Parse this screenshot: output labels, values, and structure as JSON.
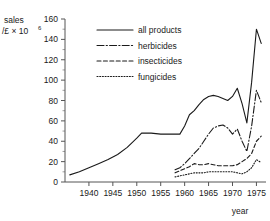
{
  "chart_data": {
    "type": "line",
    "title": "",
    "xlabel": "year",
    "ylabel": "sales /£ × 10⁶",
    "ylabel_main": "sales",
    "ylabel_unit": "/£ × 10",
    "ylabel_exponent": "6",
    "xlim": [
      1935,
      1977
    ],
    "ylim": [
      0,
      160
    ],
    "grid": false,
    "legend_position": "top-center",
    "y_ticks": [
      0,
      20,
      40,
      60,
      80,
      100,
      120,
      140,
      160
    ],
    "y_tick_labels": [
      "0",
      "20",
      "40",
      "60",
      "80",
      "100",
      "120",
      "140",
      "160"
    ],
    "y_minor_step": 10,
    "x_ticks": [
      1940,
      1945,
      1950,
      1955,
      1960,
      1965,
      1970,
      1975
    ],
    "x_tick_labels": [
      "1940",
      "1945",
      "1950",
      "1955",
      "1960",
      "1965",
      "1970",
      "1975"
    ],
    "series": [
      {
        "name": "all products",
        "style": "solid",
        "points": [
          [
            1936,
            7
          ],
          [
            1938,
            10
          ],
          [
            1940,
            14
          ],
          [
            1942,
            18
          ],
          [
            1944,
            22
          ],
          [
            1946,
            27
          ],
          [
            1948,
            34
          ],
          [
            1950,
            43
          ],
          [
            1951,
            48
          ],
          [
            1953,
            48
          ],
          [
            1955,
            47
          ],
          [
            1957,
            47
          ],
          [
            1959,
            47
          ],
          [
            1960,
            55
          ],
          [
            1961,
            66
          ],
          [
            1962,
            70
          ],
          [
            1963,
            76
          ],
          [
            1964,
            81
          ],
          [
            1965,
            84
          ],
          [
            1966,
            85
          ],
          [
            1967,
            84
          ],
          [
            1968,
            82
          ],
          [
            1969,
            80
          ],
          [
            1970,
            84
          ],
          [
            1971,
            92
          ],
          [
            1972,
            77
          ],
          [
            1973,
            58
          ],
          [
            1974,
            98
          ],
          [
            1975,
            150
          ],
          [
            1976,
            136
          ]
        ]
      },
      {
        "name": "herbicides",
        "style": "dash-dot",
        "points": [
          [
            1958,
            12
          ],
          [
            1959,
            14
          ],
          [
            1960,
            18
          ],
          [
            1961,
            23
          ],
          [
            1962,
            28
          ],
          [
            1963,
            33
          ],
          [
            1964,
            40
          ],
          [
            1965,
            47
          ],
          [
            1966,
            53
          ],
          [
            1967,
            55
          ],
          [
            1968,
            56
          ],
          [
            1969,
            53
          ],
          [
            1970,
            47
          ],
          [
            1971,
            52
          ],
          [
            1972,
            40
          ],
          [
            1973,
            30
          ],
          [
            1974,
            55
          ],
          [
            1975,
            90
          ],
          [
            1976,
            78
          ]
        ]
      },
      {
        "name": "insecticides",
        "style": "dashed",
        "points": [
          [
            1958,
            9
          ],
          [
            1959,
            11
          ],
          [
            1960,
            13
          ],
          [
            1961,
            15
          ],
          [
            1962,
            18
          ],
          [
            1963,
            17
          ],
          [
            1964,
            17
          ],
          [
            1965,
            18
          ],
          [
            1966,
            17
          ],
          [
            1967,
            16
          ],
          [
            1968,
            16
          ],
          [
            1969,
            16
          ],
          [
            1970,
            16
          ],
          [
            1971,
            17
          ],
          [
            1972,
            20
          ],
          [
            1973,
            23
          ],
          [
            1974,
            28
          ],
          [
            1975,
            40
          ],
          [
            1976,
            45
          ]
        ]
      },
      {
        "name": "fungicides",
        "style": "dotted",
        "points": [
          [
            1958,
            5
          ],
          [
            1959,
            6
          ],
          [
            1960,
            7
          ],
          [
            1961,
            8
          ],
          [
            1962,
            9
          ],
          [
            1963,
            9
          ],
          [
            1964,
            9
          ],
          [
            1965,
            10
          ],
          [
            1966,
            10
          ],
          [
            1967,
            10
          ],
          [
            1968,
            10
          ],
          [
            1969,
            10
          ],
          [
            1970,
            10
          ],
          [
            1971,
            9
          ],
          [
            1972,
            8
          ],
          [
            1973,
            10
          ],
          [
            1974,
            14
          ],
          [
            1975,
            22
          ],
          [
            1976,
            19
          ]
        ]
      }
    ],
    "legend": [
      {
        "label": "all products",
        "style": "solid"
      },
      {
        "label": "herbicides",
        "style": "dash-dot"
      },
      {
        "label": "insecticides",
        "style": "dashed"
      },
      {
        "label": "fungicides",
        "style": "dotted"
      }
    ]
  }
}
